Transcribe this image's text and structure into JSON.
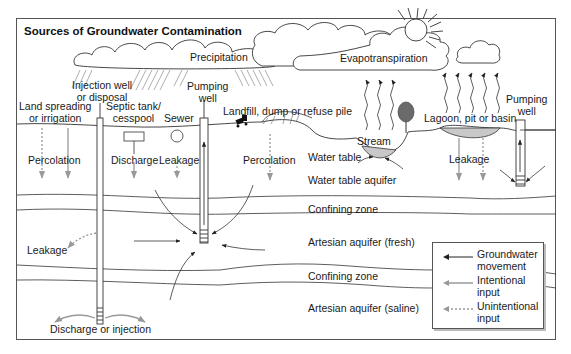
{
  "title": "Sources of Groundwater Contamination",
  "colors": {
    "frame": "#555555",
    "line": "#333333",
    "intentional": "#9a9a9a",
    "unintentional": "#9a9a9a",
    "water": "#c8c8c8",
    "tree": "#6a6a6a"
  },
  "atmosphere": {
    "precipitation": "Precipitation",
    "evapotranspiration": "Evapotranspiration"
  },
  "sources": {
    "injection_well": "Injection well\nor disposal",
    "land_spreading": "Land spreading\nor irrigation",
    "septic_tank": "Septic tank/\ncesspool",
    "sewer": "Sewer",
    "pumping_well_left": "Pumping\nwell",
    "landfill": "Landfill, dump or refuse pile",
    "stream": "Stream",
    "lagoon": "Lagoon, pit or basin",
    "pumping_well_right": "Pumping\nwell"
  },
  "processes": {
    "percolation_left": "Percolation",
    "discharge": "Discharge",
    "leakage_sewer": "Leakage",
    "percolation_landfill": "Percolation",
    "leakage_lagoon": "Leakage",
    "leakage_injection": "Leakage",
    "discharge_injection": "Discharge or injection"
  },
  "layers": {
    "water_table": "Water table",
    "water_table_aquifer": "Water table aquifer",
    "confining_zone_1": "Confining zone",
    "artesian_fresh": "Artesian aquifer (fresh)",
    "confining_zone_2": "Confining zone",
    "artesian_saline": "Artesian aquifer (saline)"
  },
  "legend": {
    "items": [
      {
        "label": "Groundwater movement",
        "style": "solid-black"
      },
      {
        "label": "Intentional input",
        "style": "solid-gray"
      },
      {
        "label": "Unintentional input",
        "style": "dashed-gray"
      }
    ]
  }
}
